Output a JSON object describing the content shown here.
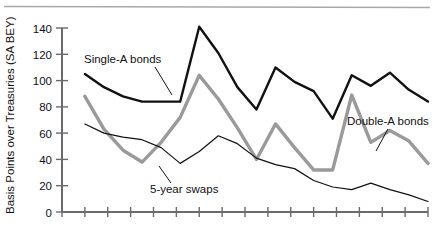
{
  "chart_data": {
    "type": "line",
    "title": "",
    "subtitle": "",
    "xlabel": "",
    "ylabel": "Basis Points over Treasuries (SA BEY)",
    "ylim": [
      0,
      140
    ],
    "ytick_labels": [
      "0",
      "20",
      "40",
      "60",
      "80",
      "100",
      "120",
      "140"
    ],
    "ytick_values": [
      0,
      20,
      40,
      60,
      80,
      100,
      120,
      140
    ],
    "grid": false,
    "legend_position": "inline-annotations",
    "x_axis": {
      "tick_count": 17,
      "tick_labels": [],
      "x_values": [
        1,
        2,
        3,
        4,
        5,
        6,
        7,
        8,
        9,
        10,
        11,
        12,
        13,
        14,
        15,
        16
      ]
    },
    "series": [
      {
        "name": "Single-A bonds",
        "color": "#111111",
        "width": 2.4,
        "values": [
          105,
          95,
          88,
          84,
          84,
          84,
          141,
          121,
          95,
          78,
          110,
          99,
          92,
          71,
          104,
          96,
          106,
          93,
          84
        ]
      },
      {
        "name": "Double-A bonds",
        "color": "#9a9a9a",
        "width": 3.4,
        "values": [
          88,
          63,
          47,
          38,
          53,
          72,
          104,
          86,
          64,
          40,
          67,
          49,
          32,
          32,
          89,
          53,
          62,
          54,
          37
        ]
      },
      {
        "name": "5-year swaps",
        "color": "#111111",
        "width": 1.2,
        "values": [
          67,
          60,
          57,
          55,
          49,
          37,
          46,
          58,
          52,
          41,
          36,
          33,
          24,
          19,
          17,
          22,
          17,
          13,
          8
        ]
      }
    ],
    "annotations": [
      {
        "text": "Single-A bonds",
        "id": "single-a-bonds"
      },
      {
        "text": "5-year swaps",
        "id": "5-year-swaps"
      },
      {
        "text": "Double-A bonds",
        "id": "double-a-bonds"
      }
    ]
  },
  "colors": {
    "single_a": "#111111",
    "double_a": "#9a9a9a",
    "swaps": "#111111",
    "axis": "#6b6b6b",
    "rule": "#a8a8a8",
    "text": "#111111"
  }
}
